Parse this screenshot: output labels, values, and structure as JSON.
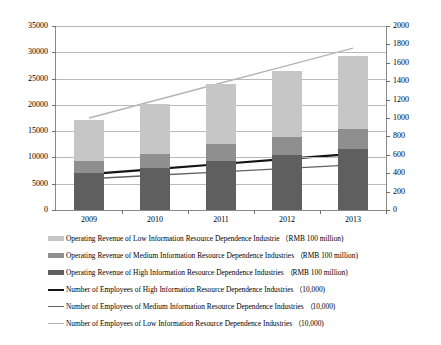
{
  "chart_data": {
    "type": "bar",
    "title": "",
    "subtitle": "",
    "xlabel": "",
    "ylabel": "",
    "categories": [
      "2009",
      "2010",
      "2011",
      "2012",
      "2013"
    ],
    "grid": true,
    "legend_position": "bottom",
    "axes": {
      "left": {
        "label": "",
        "min": 0,
        "max": 35000,
        "step": 5000,
        "ticks": [
          "0",
          "5000",
          "10000",
          "15000",
          "20000",
          "25000",
          "30000",
          "35000"
        ],
        "unit": "RMB 100 million"
      },
      "right": {
        "label": "",
        "min": 0,
        "max": 2000,
        "step": 200,
        "ticks": [
          "0",
          "200",
          "400",
          "600",
          "800",
          "1000",
          "1200",
          "1400",
          "1600",
          "1800",
          "2000"
        ],
        "unit": "10,000"
      }
    },
    "series": [
      {
        "name": "Operating Revenue of High Information Resource Dependence Industries （RMB 100 million)",
        "short": "High revenue",
        "kind": "bar-segment",
        "axis": "left",
        "color": "#5f5f5f",
        "values": [
          7100,
          8000,
          9400,
          10400,
          11600
        ]
      },
      {
        "name": "Operating Revenue of Medium Information Resource Dependence Industries （RMB 100 million)",
        "short": "Medium revenue",
        "kind": "bar-segment",
        "axis": "left",
        "color": "#8f8f8f",
        "values": [
          2200,
          2700,
          3200,
          3500,
          3900
        ]
      },
      {
        "name": "Operating Revenue of Low Information Resource Dependence Industrie （RMB 100 million)",
        "short": "Low revenue",
        "kind": "bar-segment",
        "axis": "left",
        "color": "#c6c6c6",
        "values": [
          7900,
          9400,
          11400,
          12500,
          13800
        ]
      },
      {
        "name": "Number of Employees of High Information Resource Dependence Industries （10,000)",
        "short": "High employees",
        "kind": "line",
        "axis": "right",
        "color": "#141414",
        "values": [
          390,
          445,
          500,
          555,
          610
        ]
      },
      {
        "name": "Number of Employees of Medium Information Resource Dependence Industries （10,000)",
        "short": "Medium employees",
        "kind": "line",
        "axis": "right",
        "color": "#626262",
        "values": [
          340,
          377,
          414,
          452,
          490
        ]
      },
      {
        "name": "Number of Employees of Low Information Resource Dependence Industries （10,000)",
        "short": "Low employees",
        "kind": "line",
        "axis": "right",
        "color": "#b4b4b4",
        "values": [
          1000,
          1190,
          1380,
          1570,
          1760
        ]
      }
    ],
    "bar_totals": [
      17200,
      20100,
      24000,
      26400,
      29300
    ]
  }
}
